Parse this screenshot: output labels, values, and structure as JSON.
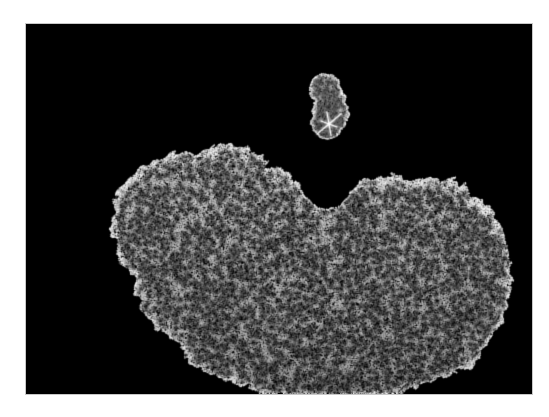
{
  "figure": {
    "kind": "molecular-dot-surface-render",
    "panel": {
      "x": 26,
      "y": 24,
      "width": 506,
      "height": 370,
      "background_color": "#000000",
      "border_color": "#c8c8c8"
    },
    "page_background_color": "#ffffff",
    "caption": "",
    "title": "",
    "labels": []
  },
  "render": {
    "surface_color": "#ffffff",
    "wireframe_color": "#f2f2f2",
    "dot_min_gray": 70,
    "dot_max_gray": 255,
    "dot_radius_px": 0.62,
    "seed": 20240517
  },
  "objects": [
    {
      "name": "ligand-molecule",
      "role": "small upper molecule",
      "center_x": 302,
      "center_y": 81,
      "radius_x": 26,
      "radius_y": 41,
      "dot_count": 5200,
      "lobes": [
        {
          "cx": 298,
          "cy": 62,
          "rx": 22,
          "ry": 20
        },
        {
          "cx": 306,
          "cy": 88,
          "rx": 22,
          "ry": 24
        },
        {
          "cx": 300,
          "cy": 104,
          "rx": 17,
          "ry": 14
        }
      ],
      "marker": {
        "name": "bright-star-vertex",
        "x": 303,
        "y": 100,
        "arm_count": 6,
        "arm_length": 11,
        "color": "#ffffff"
      }
    },
    {
      "name": "protein-molecule",
      "role": "large lower molecule",
      "center_x": 285,
      "center_y": 245,
      "dot_count": 64000,
      "cleft": {
        "cx": 300,
        "cy": 168,
        "rx": 34,
        "ry": 30
      },
      "lobes": [
        {
          "cx": 150,
          "cy": 175,
          "rx": 48,
          "ry": 40
        },
        {
          "cx": 135,
          "cy": 215,
          "rx": 42,
          "ry": 46
        },
        {
          "cx": 160,
          "cy": 260,
          "rx": 52,
          "ry": 48
        },
        {
          "cx": 200,
          "cy": 160,
          "rx": 58,
          "ry": 44
        },
        {
          "cx": 215,
          "cy": 220,
          "rx": 62,
          "ry": 56
        },
        {
          "cx": 225,
          "cy": 285,
          "rx": 60,
          "ry": 52
        },
        {
          "cx": 265,
          "cy": 195,
          "rx": 58,
          "ry": 50
        },
        {
          "cx": 280,
          "cy": 255,
          "rx": 62,
          "ry": 58
        },
        {
          "cx": 290,
          "cy": 310,
          "rx": 56,
          "ry": 46
        },
        {
          "cx": 340,
          "cy": 185,
          "rx": 52,
          "ry": 44
        },
        {
          "cx": 355,
          "cy": 245,
          "rx": 64,
          "ry": 60
        },
        {
          "cx": 350,
          "cy": 305,
          "rx": 58,
          "ry": 50
        },
        {
          "cx": 405,
          "cy": 200,
          "rx": 52,
          "ry": 46
        },
        {
          "cx": 420,
          "cy": 255,
          "rx": 54,
          "ry": 52
        },
        {
          "cx": 405,
          "cy": 305,
          "rx": 48,
          "ry": 42
        },
        {
          "cx": 445,
          "cy": 230,
          "rx": 36,
          "ry": 40
        },
        {
          "cx": 440,
          "cy": 285,
          "rx": 34,
          "ry": 32
        },
        {
          "cx": 120,
          "cy": 190,
          "rx": 30,
          "ry": 28
        },
        {
          "cx": 195,
          "cy": 310,
          "rx": 44,
          "ry": 38
        },
        {
          "cx": 250,
          "cy": 330,
          "rx": 46,
          "ry": 34
        },
        {
          "cx": 310,
          "cy": 340,
          "rx": 44,
          "ry": 30
        },
        {
          "cx": 370,
          "cy": 330,
          "rx": 42,
          "ry": 30
        }
      ]
    }
  ],
  "colors": {
    "background": "#000000",
    "page": "#ffffff",
    "surface_highlight": "#ffffff",
    "panel_border": "#c8c8c8"
  }
}
